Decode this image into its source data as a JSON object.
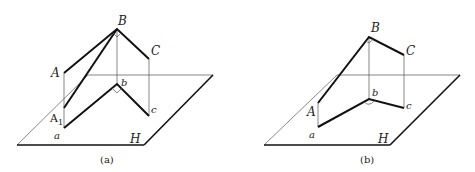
{
  "figures": [
    {
      "caption": "(a)",
      "labels": {
        "B": "B",
        "C": "C",
        "A": "A",
        "A1_base": "A",
        "A1_sub": "1",
        "a": "a",
        "b": "b",
        "c": "c",
        "H": "H"
      },
      "plane": "H",
      "right_angles": [
        "at B (in space)",
        "at b (projection)"
      ]
    },
    {
      "caption": "(b)",
      "labels": {
        "B": "B",
        "C": "C",
        "A": "A",
        "a": "a",
        "b": "b",
        "c": "c",
        "H": "H"
      },
      "plane": "H",
      "right_angles": [
        "at B (in space)"
      ]
    }
  ],
  "colors": {
    "line": "#111111",
    "thin_line": "#555555",
    "background": "#ffffff"
  }
}
